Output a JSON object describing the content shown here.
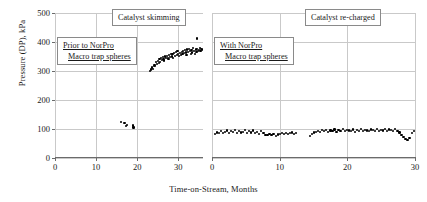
{
  "chart_data": {
    "type": "scatter",
    "title": "",
    "xlabel": "Time-on-Stream, Months",
    "ylabel": "Pressure (DP), kPa",
    "ylim": [
      0,
      500
    ],
    "yticks": [
      0,
      100,
      200,
      300,
      400,
      500
    ],
    "grid": true,
    "legend": "none",
    "panels": [
      {
        "name": "Prior to NorPro Macro trap spheres",
        "xlim": [
          0,
          36
        ],
        "xticks": [
          0,
          10,
          20,
          30
        ],
        "series": [
          {
            "name": "low-pressure-points",
            "x": [
              16.1,
              16.9,
              17.3,
              17.6,
              18.9,
              19.1
            ],
            "y": [
              124,
              121,
              110,
              115,
              112,
              105
            ]
          },
          {
            "name": "rising-pressure-cluster",
            "x": [
              23.2,
              23.4,
              23.6,
              23.8,
              24.0,
              24.2,
              24.4,
              24.6,
              24.8,
              25.0,
              25.2,
              25.4,
              25.6,
              25.8,
              26.0,
              26.2,
              26.4,
              26.6,
              26.8,
              27.0,
              27.2,
              27.4,
              27.6,
              27.8,
              28.0,
              28.2,
              28.4,
              28.6,
              28.8,
              29.0,
              29.2,
              29.4,
              29.6,
              29.8,
              30.0,
              30.2,
              30.4,
              30.6,
              30.8,
              31.0,
              31.2,
              31.4,
              31.6,
              31.8,
              32.0,
              32.2,
              32.4,
              32.6,
              32.8,
              33.0,
              33.2,
              33.4,
              33.6,
              33.8,
              34.0,
              34.2,
              34.4,
              34.6,
              34.8,
              35.0,
              35.2,
              35.4,
              35.6,
              35.8
            ],
            "y": [
              300,
              305,
              312,
              308,
              316,
              322,
              318,
              330,
              325,
              335,
              328,
              340,
              332,
              345,
              338,
              348,
              342,
              336,
              350,
              344,
              352,
              346,
              340,
              355,
              348,
              358,
              350,
              360,
              344,
              362,
              352,
              365,
              356,
              368,
              358,
              352,
              362,
              356,
              366,
              360,
              370,
              362,
              372,
              364,
              356,
              374,
              366,
              376,
              368,
              358,
              372,
              364,
              378,
              370,
              360,
              374,
              366,
              376,
              368,
              372,
              380,
              370,
              376,
              374
            ]
          },
          {
            "name": "outlier-point",
            "x": [
              34.6
            ],
            "y": [
              412
            ]
          }
        ]
      },
      {
        "name": "With NorPro Macro trap spheres",
        "xlim": [
          0,
          30
        ],
        "xticks": [
          0,
          10,
          20,
          30
        ],
        "series": [
          {
            "name": "stable-pressure-segment-1",
            "x": [
              0.4,
              0.7,
              1.0,
              1.3,
              1.6,
              1.9,
              2.2,
              2.5,
              2.8,
              3.1,
              3.4,
              3.7,
              4.0,
              4.3,
              4.6,
              4.9,
              5.2,
              5.5,
              5.8,
              6.1,
              6.4,
              6.7,
              7.0,
              7.3,
              7.6,
              7.9,
              8.2,
              8.5,
              8.8,
              9.1,
              9.4,
              9.7,
              10.0,
              10.3,
              10.6,
              10.9,
              11.2,
              11.5,
              11.8,
              12.1,
              12.4
            ],
            "y": [
              84,
              88,
              86,
              92,
              85,
              90,
              95,
              87,
              93,
              89,
              96,
              86,
              94,
              88,
              91,
              97,
              85,
              92,
              88,
              95,
              87,
              90,
              84,
              93,
              86,
              80,
              78,
              82,
              79,
              83,
              77,
              81,
              84,
              86,
              83,
              87,
              82,
              85,
              88,
              84,
              86
            ]
          },
          {
            "name": "stable-pressure-segment-2",
            "x": [
              14.5,
              14.8,
              15.1,
              15.4,
              15.7,
              16.0,
              16.3,
              16.6,
              16.9,
              17.2,
              17.5,
              17.8,
              18.1,
              18.4,
              18.7,
              19.0,
              19.3,
              19.6,
              19.9,
              20.2,
              20.5,
              20.8,
              21.1,
              21.4,
              21.7,
              22.0,
              22.3,
              22.6,
              22.9,
              23.2,
              23.5,
              23.8,
              24.1,
              24.4,
              24.7,
              25.0,
              25.3,
              25.6,
              25.9,
              26.2,
              26.5,
              26.8,
              27.1,
              27.4,
              27.7,
              28.0,
              28.3,
              28.6,
              28.9,
              29.2,
              29.5,
              29.8
            ],
            "y": [
              76,
              82,
              88,
              91,
              94,
              89,
              96,
              92,
              97,
              90,
              95,
              93,
              98,
              91,
              96,
              94,
              99,
              92,
              97,
              95,
              93,
              98,
              91,
              96,
              94,
              99,
              92,
              97,
              95,
              93,
              98,
              96,
              94,
              99,
              92,
              97,
              95,
              100,
              93,
              98,
              96,
              94,
              99,
              92,
              88,
              80,
              72,
              66,
              62,
              70,
              85,
              93
            ]
          }
        ]
      }
    ],
    "annotations": [
      {
        "id": "catalyst-skimming",
        "text": "Catalyst skimming",
        "panel": 0
      },
      {
        "id": "catalyst-recharged",
        "text": "Catalyst re-charged",
        "panel": 1
      },
      {
        "id": "prior-to-norpro",
        "line1": "Prior to NorPro",
        "line2": "Macro trap spheres",
        "panel": 0
      },
      {
        "id": "with-norpro",
        "line1": "With NorPro",
        "line2": "Macro trap spheres",
        "panel": 1
      }
    ]
  }
}
